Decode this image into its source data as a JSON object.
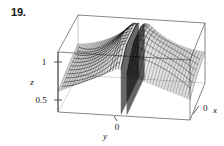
{
  "figure": {
    "number_label": "19.",
    "caption": ""
  },
  "chart_data": {
    "type": "line",
    "title": "",
    "subtitle": "",
    "plot_kind": "3d-surface-wireframe",
    "xlabel": "x",
    "ylabel": "y",
    "zlabel": "z",
    "x_tick_labels": [
      "0"
    ],
    "y_tick_labels": [
      "0"
    ],
    "z_tick_labels": [
      "1",
      "0.5"
    ],
    "z_tick_values": [
      1,
      0.5
    ],
    "zlim": [
      0.35,
      1.35
    ],
    "xlim": [
      -1,
      1
    ],
    "ylim": [
      -1,
      1
    ],
    "grid": false,
    "legend_position": "none",
    "annotations": [],
    "surface_mesh": {
      "u_lines": 46,
      "v_lines": 46,
      "contour_lines": 11
    },
    "series": [
      {
        "name": "z-surface-left-branch",
        "z_range": [
          0.4,
          1.3
        ]
      },
      {
        "name": "z-surface-right-branch",
        "z_range": [
          0.4,
          1.3
        ]
      }
    ],
    "box_corners": {
      "back_top_left": [
        78,
        15
      ],
      "back_top_right": [
        205,
        23
      ],
      "front_top_left": [
        58,
        52
      ],
      "front_top_right": [
        190,
        60
      ],
      "back_bottom_left": [
        78,
        75
      ],
      "back_bottom_right": [
        205,
        83
      ],
      "front_bottom_left": [
        58,
        112
      ],
      "front_bottom_right": [
        190,
        120
      ]
    }
  },
  "colors": {
    "ink": "#111111",
    "box_line": "#555555",
    "mesh_dark": "#1a1a1a",
    "mesh_light": "#7a7a7a",
    "background": "#ffffff"
  }
}
